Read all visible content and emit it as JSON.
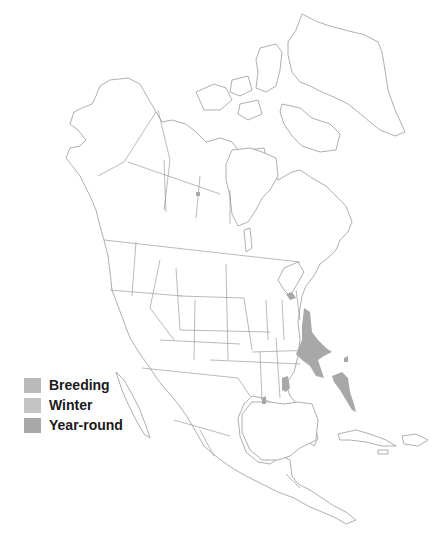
{
  "map": {
    "title": "Range map — North America",
    "colors": {
      "outline": "#8c8c8c",
      "breeding": "#b9b9b9",
      "winter": "#c4c4c4",
      "year_round": "#a8a8a8"
    }
  },
  "legend": {
    "items": [
      {
        "label": "Breeding",
        "color": "#b9b9b9"
      },
      {
        "label": "Winter",
        "color": "#c4c4c4"
      },
      {
        "label": "Year-round",
        "color": "#a8a8a8"
      }
    ]
  },
  "range_regions": [
    {
      "name": "indiana-kentucky-tennessee-georgia",
      "type": "year_round"
    },
    {
      "name": "wisconsin",
      "type": "year_round"
    },
    {
      "name": "florida",
      "type": "year_round"
    },
    {
      "name": "louisiana-texas-coast",
      "type": "year_round"
    },
    {
      "name": "south-carolina",
      "type": "year_round"
    },
    {
      "name": "tamaulipas-coast",
      "type": "year_round"
    },
    {
      "name": "saskatchewan-spot",
      "type": "year_round"
    }
  ]
}
